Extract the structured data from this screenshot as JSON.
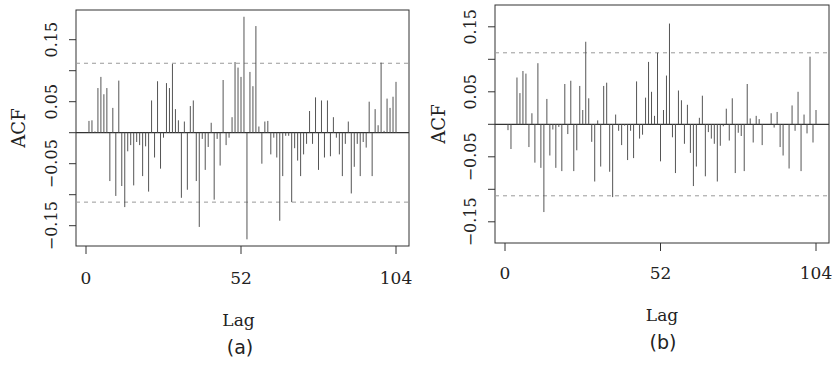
{
  "chart_data": [
    {
      "type": "bar",
      "subtype": "acf-lollipop",
      "panel_label": "(a)",
      "title": "",
      "xlabel": "Lag",
      "ylabel": "ACF",
      "xlim": [
        -3,
        107
      ],
      "ylim": [
        -0.19,
        0.2
      ],
      "xticks": [
        0,
        52,
        104
      ],
      "xtick_labels": [
        "0",
        "52",
        "104"
      ],
      "yticks": [
        -0.15,
        -0.1,
        -0.05,
        0.0,
        0.05,
        0.1,
        0.15,
        0.2
      ],
      "ytick_labels": [
        "-0.15",
        "",
        "-0.05",
        "",
        "0.05",
        "",
        "0.15",
        ""
      ],
      "confidence_bounds": [
        0.112,
        -0.112
      ],
      "grid": false,
      "legend": "none",
      "lags": [
        1,
        2,
        3,
        4,
        5,
        6,
        7,
        8,
        9,
        10,
        11,
        12,
        13,
        14,
        15,
        16,
        17,
        18,
        19,
        20,
        21,
        22,
        23,
        24,
        25,
        26,
        27,
        28,
        29,
        30,
        31,
        32,
        33,
        34,
        35,
        36,
        37,
        38,
        39,
        40,
        41,
        42,
        43,
        44,
        45,
        46,
        47,
        48,
        49,
        50,
        51,
        52,
        53,
        54,
        55,
        56,
        57,
        58,
        59,
        60,
        61,
        62,
        63,
        64,
        65,
        66,
        67,
        68,
        69,
        70,
        71,
        72,
        73,
        74,
        75,
        76,
        77,
        78,
        79,
        80,
        81,
        82,
        83,
        84,
        85,
        86,
        87,
        88,
        89,
        90,
        91,
        92,
        93,
        94,
        95,
        96,
        97,
        98,
        99,
        100,
        101,
        102,
        103,
        104
      ],
      "values": [
        0.019,
        0.02,
        0.002,
        0.072,
        0.09,
        0.062,
        0.072,
        -0.078,
        0.04,
        -0.102,
        0.084,
        -0.086,
        -0.12,
        -0.03,
        -0.02,
        -0.085,
        -0.015,
        -0.02,
        -0.07,
        -0.022,
        -0.095,
        0.052,
        -0.04,
        0.083,
        -0.058,
        -0.008,
        0.08,
        0.072,
        0.111,
        0.038,
        0.02,
        -0.105,
        0.018,
        -0.092,
        0.043,
        0.052,
        -0.078,
        -0.152,
        -0.01,
        -0.06,
        -0.023,
        0.016,
        -0.108,
        -0.01,
        -0.053,
        0.085,
        -0.02,
        -0.008,
        0.025,
        0.114,
        0.105,
        0.09,
        0.187,
        -0.172,
        0.098,
        0.075,
        0.172,
        0.01,
        -0.05,
        0.018,
        0.019,
        -0.035,
        -0.008,
        -0.04,
        -0.142,
        -0.07,
        -0.005,
        -0.005,
        -0.112,
        -0.025,
        -0.045,
        -0.07,
        -0.035,
        -0.018,
        0.035,
        -0.018,
        0.057,
        -0.06,
        0.052,
        -0.04,
        0.052,
        -0.038,
        0.025,
        -0.008,
        -0.035,
        -0.07,
        -0.018,
        0.018,
        -0.098,
        -0.055,
        -0.018,
        -0.07,
        -0.015,
        -0.024,
        0.05,
        -0.07,
        0.038,
        0.012,
        0.113,
        0.003,
        0.055,
        0.04,
        0.058,
        0.082
      ]
    },
    {
      "type": "bar",
      "subtype": "acf-lollipop",
      "panel_label": "(b)",
      "title": "",
      "xlabel": "Lag",
      "ylabel": "ACF",
      "xlim": [
        -3,
        107
      ],
      "ylim": [
        -0.19,
        0.18
      ],
      "xticks": [
        0,
        52,
        104
      ],
      "xtick_labels": [
        "0",
        "52",
        "104"
      ],
      "yticks": [
        -0.15,
        -0.1,
        -0.05,
        0.0,
        0.05,
        0.1,
        0.15
      ],
      "ytick_labels": [
        "-0.15",
        "",
        "-0.05",
        "",
        "0.05",
        "",
        "0.15"
      ],
      "confidence_bounds": [
        0.11,
        -0.11
      ],
      "grid": false,
      "legend": "none",
      "lags": [
        1,
        2,
        3,
        4,
        5,
        6,
        7,
        8,
        9,
        10,
        11,
        12,
        13,
        14,
        15,
        16,
        17,
        18,
        19,
        20,
        21,
        22,
        23,
        24,
        25,
        26,
        27,
        28,
        29,
        30,
        31,
        32,
        33,
        34,
        35,
        36,
        37,
        38,
        39,
        40,
        41,
        42,
        43,
        44,
        45,
        46,
        47,
        48,
        49,
        50,
        51,
        52,
        53,
        54,
        55,
        56,
        57,
        58,
        59,
        60,
        61,
        62,
        63,
        64,
        65,
        66,
        67,
        68,
        69,
        70,
        71,
        72,
        73,
        74,
        75,
        76,
        77,
        78,
        79,
        80,
        81,
        82,
        83,
        84,
        85,
        86,
        87,
        88,
        89,
        90,
        91,
        92,
        93,
        94,
        95,
        96,
        97,
        98,
        99,
        100,
        101,
        102,
        103,
        104
      ],
      "values": [
        -0.009,
        -0.038,
        0.0,
        0.072,
        0.048,
        0.082,
        0.078,
        -0.035,
        0.017,
        -0.059,
        0.094,
        -0.067,
        -0.135,
        0.039,
        -0.048,
        -0.008,
        -0.067,
        -0.004,
        -0.072,
        0.062,
        -0.015,
        0.067,
        -0.072,
        -0.04,
        0.059,
        0.022,
        0.127,
        0.04,
        -0.027,
        -0.088,
        0.006,
        -0.065,
        0.059,
        0.064,
        -0.073,
        -0.112,
        0.015,
        -0.01,
        -0.032,
        -0.002,
        -0.055,
        -0.01,
        -0.052,
        0.066,
        -0.022,
        -0.016,
        0.041,
        0.096,
        0.05,
        0.013,
        0.11,
        -0.057,
        0.022,
        0.075,
        0.155,
        -0.02,
        -0.075,
        0.052,
        0.037,
        -0.03,
        0.03,
        -0.044,
        -0.095,
        -0.065,
        0.01,
        0.044,
        -0.08,
        -0.012,
        -0.022,
        -0.03,
        -0.088,
        -0.033,
        -0.003,
        0.024,
        -0.025,
        0.04,
        -0.075,
        -0.013,
        -0.018,
        -0.072,
        0.062,
        0.009,
        -0.028,
        0.013,
        0.008,
        -0.032,
        0.0,
        0.0,
        0.017,
        -0.005,
        0.019,
        -0.035,
        -0.048,
        0.0,
        -0.068,
        0.029,
        -0.01,
        0.05,
        -0.072,
        0.015,
        -0.014,
        0.104,
        -0.028,
        0.022,
        0.008,
        0.037,
        -0.057
      ]
    }
  ],
  "panels": [
    {
      "caption": "(a)",
      "xlabel": "Lag",
      "ylabel": "ACF"
    },
    {
      "caption": "(b)",
      "xlabel": "Lag",
      "ylabel": "ACF"
    }
  ],
  "colors": {
    "bar": "#555555",
    "frame": "#333333",
    "bounds": "#999999",
    "text": "#222222"
  }
}
